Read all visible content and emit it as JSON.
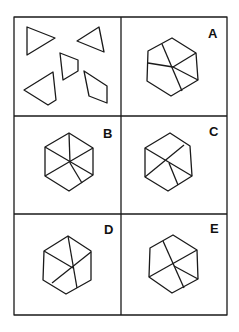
{
  "puzzle": {
    "question_panel": {
      "description": "five loose pieces: three triangles, one trapezoid, one quadrilateral"
    },
    "options": [
      {
        "label": "A"
      },
      {
        "label": "B"
      },
      {
        "label": "C"
      },
      {
        "label": "D"
      },
      {
        "label": "E"
      }
    ]
  },
  "colors": {
    "stroke": "#1a1a1a",
    "background": "#ffffff"
  }
}
